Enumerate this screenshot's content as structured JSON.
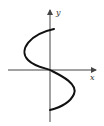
{
  "figure": {
    "axes": {
      "x_label": "x",
      "y_label": "y"
    },
    "colors": {
      "background": "#ffffff",
      "axis": "#444444",
      "curve": "#111111"
    }
  }
}
